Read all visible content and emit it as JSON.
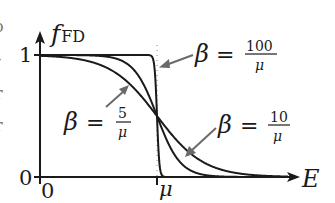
{
  "chart_data": {
    "type": "line",
    "title": "",
    "xlabel": "E",
    "ylabel": "f_FD",
    "ylabel_main": "f",
    "ylabel_sub": "FD",
    "x_ticks": [
      {
        "value": 0,
        "label": "0"
      },
      {
        "value": 1,
        "label": "μ"
      }
    ],
    "y_ticks": [
      {
        "value": 0,
        "label": "0"
      },
      {
        "value": 1,
        "label": "1"
      }
    ],
    "xlim": [
      0,
      2.2
    ],
    "ylim": [
      0,
      1.0
    ],
    "grid": false,
    "legend": "inline annotations with arrows",
    "function": "f_FD(E) = 1 / (exp(β(E − μ)) + 1), E in units of μ",
    "series": [
      {
        "name": "β = 5/μ",
        "beta_mu": 5,
        "x": [
          0,
          0.2,
          0.4,
          0.6,
          0.8,
          1.0,
          1.2,
          1.4,
          1.6,
          1.8,
          2.0,
          2.2
        ],
        "values": [
          0.993,
          0.982,
          0.953,
          0.881,
          0.731,
          0.5,
          0.269,
          0.119,
          0.047,
          0.018,
          0.007,
          0.002
        ]
      },
      {
        "name": "β = 10/μ",
        "beta_mu": 10,
        "x": [
          0,
          0.2,
          0.4,
          0.6,
          0.8,
          1.0,
          1.2,
          1.4,
          1.6,
          1.8,
          2.0,
          2.2
        ],
        "values": [
          1.0,
          1.0,
          0.998,
          0.982,
          0.881,
          0.5,
          0.119,
          0.018,
          0.002,
          0.0,
          0.0,
          0.0
        ]
      },
      {
        "name": "β = 100/μ",
        "beta_mu": 100,
        "x": [
          0,
          0.2,
          0.4,
          0.6,
          0.8,
          0.97,
          1.0,
          1.03,
          1.2,
          1.4,
          1.6,
          2.2
        ],
        "values": [
          1.0,
          1.0,
          1.0,
          1.0,
          1.0,
          0.953,
          0.5,
          0.047,
          0.0,
          0.0,
          0.0,
          0.0
        ]
      }
    ],
    "annotations": [
      {
        "text": "β = 100/μ",
        "beta": "β",
        "eq": "=",
        "num": "100",
        "den": "μ",
        "points_to": "β = 100/μ curve near E = μ, f ≈ 0.85"
      },
      {
        "text": "β = 5/μ",
        "beta": "β",
        "eq": "=",
        "num": "5",
        "den": "μ",
        "points_to": "β = 5/μ curve near E ≈ 0.75μ"
      },
      {
        "text": "β = 10/μ",
        "beta": "β",
        "eq": "=",
        "num": "10",
        "den": "μ",
        "points_to": "β = 10/μ curve near E ≈ 1.3μ"
      }
    ],
    "reference_line": {
      "type": "dotted vertical",
      "at_x": "μ"
    }
  },
  "left_edge_fragments": [
    "o",
    "-",
    "r",
    "r"
  ]
}
